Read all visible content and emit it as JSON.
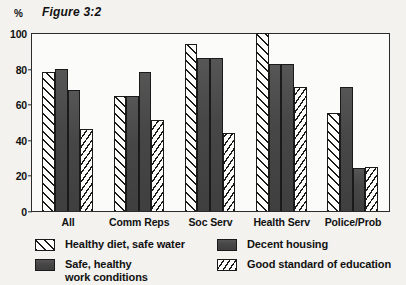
{
  "header": {
    "axis_unit": "%",
    "figure_title": "Figure 3:2"
  },
  "chart_data": {
    "type": "bar",
    "title": "Figure 3:2",
    "xlabel": "",
    "ylabel": "%",
    "ylim": [
      0,
      100
    ],
    "yticks": [
      0,
      20,
      40,
      60,
      80,
      100
    ],
    "grid": false,
    "legend_position": "bottom",
    "categories": [
      "All",
      "Comm Reps",
      "Soc Serv",
      "Health Serv",
      "Police/Prob"
    ],
    "series": [
      {
        "name": "Healthy diet, safe water",
        "pattern": "diagonal-hatch-forward",
        "values": [
          78,
          65,
          94,
          100,
          55
        ]
      },
      {
        "name": "Safe, healthy\nwork conditions",
        "pattern": "solid-dark-grey",
        "values": [
          80,
          65,
          86,
          83,
          70
        ]
      },
      {
        "name": "Decent housing",
        "pattern": "solid-dark-grey",
        "values": [
          68,
          78,
          86,
          83,
          24
        ]
      },
      {
        "name": "Good standard of education",
        "pattern": "diagonal-hatch-dense",
        "values": [
          46,
          51,
          44,
          70,
          25
        ]
      }
    ]
  },
  "colors": {
    "solid_bar": "#4a4a4a",
    "hatch_line": "#1a1a1a",
    "bar_fill": "#fdfdfb",
    "frame": "#2b2b2b",
    "page_background": "#f3f2ef",
    "plot_background": "#fbfbf9"
  }
}
